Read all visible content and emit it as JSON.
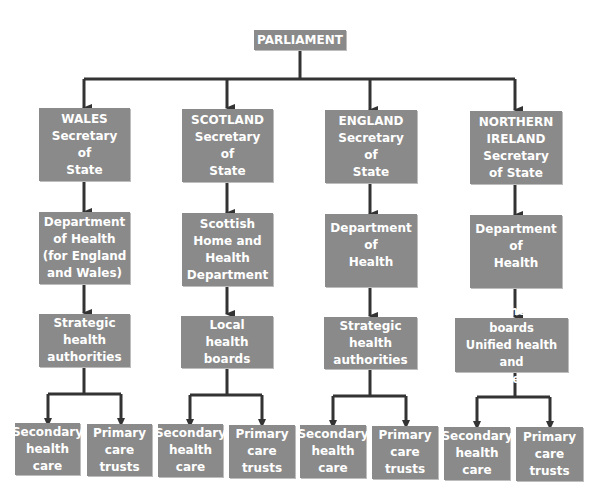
{
  "root": {
    "label": "PARLIAMENT"
  },
  "branches": [
    {
      "secretary": "WALES\nSecretary\nof\nState",
      "department": "Department\nof Health\n(for England\nand Wales)",
      "authority": "Strategic\nhealth\nauthorities",
      "leaves": [
        "Secondary\nhealth\ncare",
        "Primary\ncare\ntrusts"
      ]
    },
    {
      "secretary": "SCOTLAND\nSecretary\nof\nState",
      "department": "Scottish\nHome and\nHealth\nDepartment",
      "authority": "Local\nhealth\nboards",
      "leaves": [
        "Secondary\nhealth\ncare",
        "Primary\ncare\ntrusts"
      ]
    },
    {
      "secretary": "ENGLAND\nSecretary\nof\nState",
      "department": "Department\nof\nHealth",
      "authority": "Strategic\nhealth\nauthorities",
      "leaves": [
        "Secondary\nhealth\ncare",
        "Primary\ncare\ntrusts"
      ]
    },
    {
      "secretary": "NORTHERN\nIRELAND\nSecretary\nof State",
      "department": "Department\nof\nHealth",
      "authority": "Local health boards\nUnified health and\nsocial services",
      "leaves": [
        "Secondary\nhealth\ncare",
        "Primary\ncare\ntrusts"
      ]
    }
  ],
  "colors": {
    "box": "#8a8a8a",
    "text": "#ffffff",
    "line": "#333333"
  }
}
